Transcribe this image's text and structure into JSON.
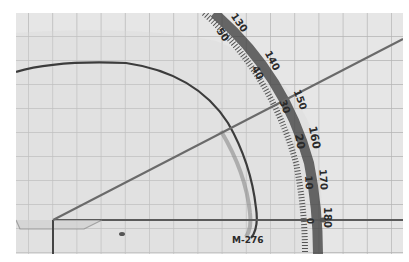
{
  "scene": {
    "description": "Photograph of a semicircular protractor placed on grid paper measuring an angle",
    "background_color": "#e4e4e4",
    "grid_color": "#b8b8b8",
    "line_color": "#6a6a6a"
  },
  "protractor": {
    "model_label": "M-276",
    "measured_angle_deg": 30,
    "scale_labels": [
      {
        "outer": "130",
        "inner": "50"
      },
      {
        "outer": "140",
        "inner": "40"
      },
      {
        "outer": "150",
        "inner": "30"
      },
      {
        "outer": "160",
        "inner": "20"
      },
      {
        "outer": "170",
        "inner": "10"
      },
      {
        "outer": "180",
        "inner": "0"
      }
    ]
  }
}
